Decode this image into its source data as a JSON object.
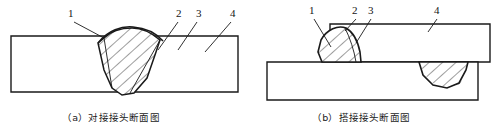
{
  "figure": {
    "kind": "technical-line-drawing",
    "line_color": "#1a1a1a",
    "hatch_color": "#1a1a1a",
    "fill_color": "#ffffff",
    "background": "#ffffff"
  },
  "panels": [
    {
      "id": "a",
      "caption": "（a）对接接头断面图",
      "caption_x": 62,
      "caption_y": 110,
      "callouts": [
        {
          "text": "1",
          "x": 68,
          "y": 9,
          "leader": "M 74 22 L 104 38"
        },
        {
          "text": "2",
          "x": 176,
          "y": 9,
          "leader": "M 178 22 L 158 50"
        },
        {
          "text": "3",
          "x": 196,
          "y": 9,
          "leader": "M 197 22 L 178 50"
        },
        {
          "text": "4",
          "x": 231,
          "y": 9,
          "leader": "M 231 22 L 205 52"
        }
      ]
    },
    {
      "id": "b",
      "caption": "（b）搭接接头断面图",
      "caption_x": 312,
      "caption_y": 110,
      "callouts": [
        {
          "text": "1",
          "x": 310,
          "y": 6,
          "leader": "M 314 19 L 330 46"
        },
        {
          "text": "2",
          "x": 352,
          "y": 6,
          "leader": "M 354 19 L 344 32"
        },
        {
          "text": "3",
          "x": 368,
          "y": 6,
          "leader": "M 369 19 L 354 42"
        },
        {
          "text": "4",
          "x": 434,
          "y": 6,
          "leader": "M 435 19 L 428 32"
        }
      ]
    }
  ],
  "callout_numbers": [
    "1",
    "2",
    "3",
    "4"
  ],
  "captions": {
    "a": "（a）对接接头断面图",
    "b": "（b）搭接接头断面图"
  }
}
